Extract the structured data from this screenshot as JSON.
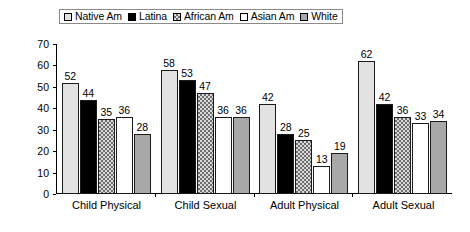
{
  "chart_data": {
    "type": "bar",
    "title": "",
    "xlabel": "",
    "ylabel": "",
    "ylim": [
      0,
      70
    ],
    "yticks": [
      0,
      10,
      20,
      30,
      40,
      50,
      60,
      70
    ],
    "grid": false,
    "legend_position": "top-center",
    "categories": [
      "Child Physical",
      "Child Sexual",
      "Adult Physical",
      "Adult Sexual"
    ],
    "series": [
      {
        "name": "Native Am",
        "values": [
          52,
          58,
          42,
          62
        ],
        "swatch": "fill-nativeam",
        "color": "#e2e2e2"
      },
      {
        "name": "Latina",
        "values": [
          44,
          53,
          28,
          42
        ],
        "swatch": "fill-latina",
        "color": "#000000"
      },
      {
        "name": "African Am",
        "values": [
          35,
          47,
          25,
          36
        ],
        "swatch": "fill-africanam",
        "color": "#6e6e6e"
      },
      {
        "name": "Asian Am",
        "values": [
          36,
          36,
          13,
          33
        ],
        "swatch": "fill-asianam",
        "color": "#ffffff"
      },
      {
        "name": "White",
        "values": [
          28,
          36,
          19,
          34
        ],
        "swatch": "fill-white",
        "color": "#a8a8a8"
      }
    ]
  }
}
